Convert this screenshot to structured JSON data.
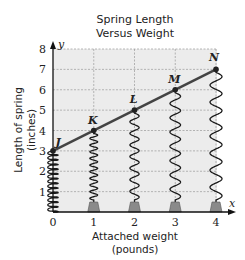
{
  "chart_data": {
    "type": "line",
    "title": "Spring Length Versus Weight",
    "title_lines": [
      "Spring Length",
      "Versus Weight"
    ],
    "xlabel": "Attached weight (pounds)",
    "xlabel_lines": [
      "Attached weight",
      "(pounds)"
    ],
    "ylabel": "Length of spring (inches)",
    "ylabel_lines": [
      "Length of spring",
      "(inches)"
    ],
    "x_axis_var": "x",
    "y_axis_var": "y",
    "x": [
      0,
      1,
      2,
      3,
      4
    ],
    "y": [
      3,
      4,
      5,
      6,
      7
    ],
    "point_labels": [
      "J",
      "K",
      "L",
      "M",
      "N"
    ],
    "xlim": [
      0,
      4
    ],
    "ylim": [
      0,
      8
    ],
    "x_ticks": [
      "0",
      "1",
      "2",
      "3",
      "4"
    ],
    "y_ticks": [
      "1",
      "2",
      "3",
      "4",
      "5",
      "6",
      "7",
      "8"
    ],
    "grid": true,
    "legend": null,
    "annotations": "Springs drawn hanging from each point down to x-axis, with weights at x = 1, 2, 3, 4",
    "colors": {
      "line": "#444444",
      "grid_fill": "#ececec",
      "grid_lines": "#9a9a9a",
      "weight_fill": "#8a8a8a",
      "text": "#222222"
    }
  }
}
